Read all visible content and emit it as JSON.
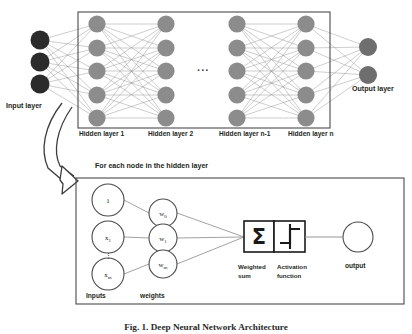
{
  "figure": {
    "caption": "Fig. 1.  Deep Neural Network Architecture",
    "top_diagram": {
      "input_layer_label": "Input layer",
      "output_layer_label": "Output layer",
      "ellipsis": "...",
      "hidden_layer_labels": [
        "Hidden layer 1",
        "Hidden layer 2",
        "Hidden layer n-1",
        "Hidden layer n"
      ],
      "counts": {
        "input_nodes": 3,
        "hidden_nodes_per_layer": 5,
        "hidden_layers_shown": 4,
        "output_nodes": 2
      }
    },
    "detail_box": {
      "title": "For each node in the hidden layer",
      "inputs_label": "Inputs",
      "weights_label": "weights",
      "vertical_dots": "⋮",
      "input_nodes": [
        {
          "base": "1",
          "sub": ""
        },
        {
          "base": "x",
          "sub": "1"
        },
        {
          "base": "x",
          "sub": "m"
        }
      ],
      "weight_nodes": [
        {
          "base": "w",
          "sub": "0"
        },
        {
          "base": "w",
          "sub": "1"
        },
        {
          "base": "w",
          "sub": "m"
        }
      ],
      "sum_symbol": "Σ",
      "weighted_sum_label_line1": "Weighted",
      "weighted_sum_label_line2": "sum",
      "activation_label_line1": "Activation",
      "activation_label_line2": "function",
      "output_label": "output"
    },
    "colors": {
      "input_node_fill": "#2b2b2b",
      "hidden_node_fill": "#8c8c8c",
      "output_node_fill": "#6e6e6e",
      "edge": "#8a8a8a",
      "box_border": "#4a4a4a",
      "detail_circle_stroke": "#4a4a4a",
      "text": "#231f20",
      "arrow_stroke": "#3d3d3d"
    }
  }
}
